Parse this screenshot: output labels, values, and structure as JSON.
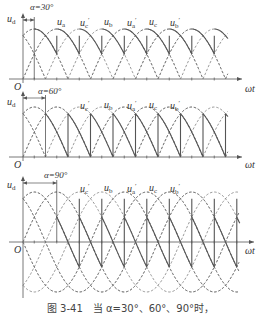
{
  "figure": {
    "caption": "图 3-41　当 α=30°、60°、90°时，",
    "axis_x_label": "ωt",
    "axis_y_label_base": "u",
    "axis_y_label_sub": "d",
    "origin_label": "O",
    "phase_labels": [
      {
        "base": "u",
        "sub": "a",
        "prime": ""
      },
      {
        "base": "u",
        "sub": "c",
        "prime": "′"
      },
      {
        "base": "u",
        "sub": "b",
        "prime": ""
      },
      {
        "base": "u",
        "sub": "a",
        "prime": "′"
      },
      {
        "base": "u",
        "sub": "c",
        "prime": ""
      },
      {
        "base": "u",
        "sub": "b",
        "prime": "′"
      }
    ],
    "colors": {
      "line": "#555555",
      "dash": "#6e6e6e",
      "text": "#333333"
    }
  },
  "panels": [
    {
      "alpha_label": "α=30°",
      "alpha_deg": 30,
      "origin": [
        23,
        79
      ],
      "amp": 50,
      "px_per_deg": 0.375,
      "x_end": 228,
      "full_wave": false,
      "label_y": 17,
      "label_xs": [
        57,
        80,
        104,
        127,
        149,
        170
      ]
    },
    {
      "alpha_label": "α=60°",
      "alpha_deg": 60,
      "origin": [
        23,
        157
      ],
      "amp": 50,
      "px_per_deg": 0.375,
      "x_end": 228,
      "full_wave": false,
      "label_y": 100,
      "label_xs": [
        80,
        104,
        127,
        149,
        170
      ],
      "label_skip_first": true
    },
    {
      "alpha_label": "α=90°",
      "alpha_deg": 90,
      "origin": [
        23,
        242
      ],
      "amp": 50,
      "px_per_deg": 0.375,
      "x_end": 240,
      "full_wave": true,
      "label_y": 183,
      "label_xs": [
        80,
        104,
        127,
        149,
        170
      ],
      "label_skip_first": true
    }
  ]
}
